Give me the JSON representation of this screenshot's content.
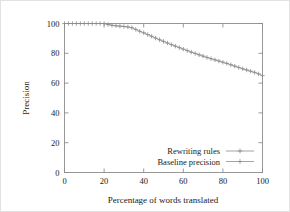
{
  "chart_data": {
    "type": "line",
    "title": "",
    "subtitle": "",
    "xlabel": "Percentage of words translated",
    "ylabel": "Precision",
    "xlim": [
      0,
      100
    ],
    "ylim": [
      0,
      100
    ],
    "xticks": [
      0,
      20,
      40,
      60,
      80,
      100
    ],
    "yticks": [
      0,
      20,
      40,
      60,
      80,
      100
    ],
    "xtick_labels": [
      "0",
      "20",
      "40",
      "60",
      "80",
      "100"
    ],
    "ytick_labels": [
      "0",
      "20",
      "40",
      "60",
      "80",
      "100"
    ],
    "grid": false,
    "legend_position": "lower right inside plot",
    "legend": [
      {
        "name": "Rewriting rules",
        "marker": "plus",
        "has_sample_line": true
      },
      {
        "name": "Baseline precision",
        "marker": "plus",
        "has_sample_line": true
      }
    ],
    "series": [
      {
        "name": "Rewriting rules",
        "marker": "plus",
        "color": "#9a9a9a",
        "x": [
          0,
          2,
          4,
          6,
          8,
          10,
          12,
          14,
          16,
          18,
          20,
          22,
          24,
          26,
          28,
          30,
          32,
          34,
          36,
          38,
          40,
          42,
          44,
          46,
          48,
          50,
          52,
          54,
          56,
          58,
          60,
          62,
          64,
          66,
          68,
          70,
          72,
          74,
          76,
          78,
          80,
          82,
          84,
          86,
          88,
          90,
          92,
          94,
          96,
          98,
          100
        ],
        "y": [
          100,
          100,
          100,
          100,
          100,
          100,
          100,
          100,
          100,
          100,
          100,
          99.3,
          98.8,
          98.5,
          98.2,
          98.0,
          97.7,
          97.2,
          96.0,
          94.8,
          93.8,
          92.6,
          91.4,
          90.2,
          89.1,
          88.0,
          86.9,
          85.8,
          84.8,
          83.8,
          82.8,
          81.8,
          80.8,
          79.9,
          79.0,
          78.1,
          77.2,
          76.4,
          75.6,
          74.8,
          74.0,
          73.2,
          72.3,
          71.4,
          70.5,
          69.6,
          68.8,
          68.0,
          67.2,
          66.2,
          65.0
        ]
      },
      {
        "name": "Baseline precision",
        "marker": "plus",
        "color": "#c8c8c8",
        "x": [],
        "y": []
      }
    ]
  },
  "axes": {
    "ylabel": "Precision",
    "xlabel": "Percentage of words translated"
  },
  "colors": {
    "frame": "#8d8d8d",
    "series_rewriting": "#9a9a9a",
    "text": "#1a1a1a",
    "background": "#ffffff"
  }
}
